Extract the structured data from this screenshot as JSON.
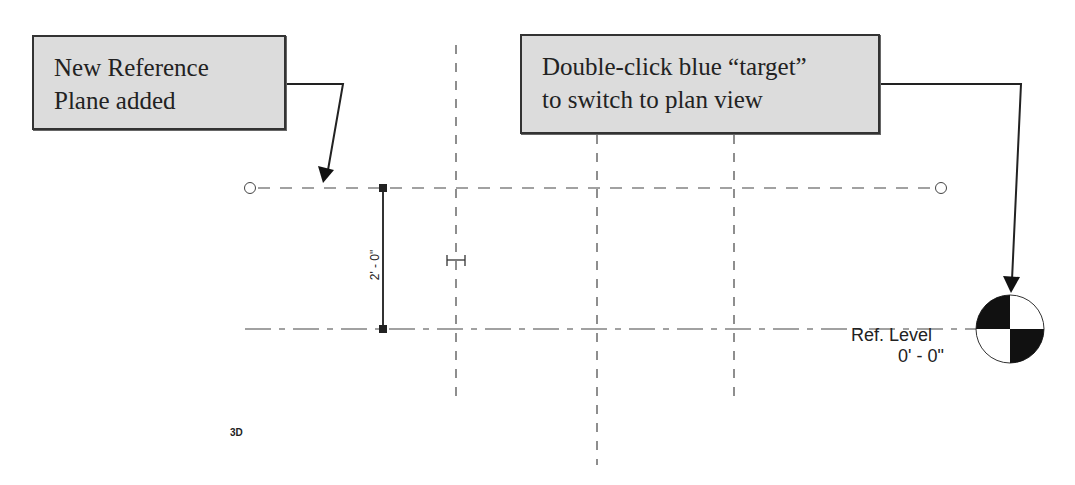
{
  "callouts": [
    {
      "lines": [
        "New Reference",
        "Plane added"
      ]
    },
    {
      "lines": [
        "Double-click blue “target”",
        "to switch to plan view"
      ]
    }
  ],
  "level": {
    "name": "Ref. Level",
    "elevation": "0' - 0\""
  },
  "dimension": {
    "value": "2' - 0\""
  },
  "view": {
    "label": "3D"
  },
  "colors": {
    "callout_bg": "#dcdcdc",
    "line": "#333333",
    "marker_fill": "#111111"
  },
  "icons": [
    "level-target-icon",
    "reference-plane-end-icon",
    "dimension-grip-icon",
    "ibeam-cursor-icon",
    "arrow-icon"
  ]
}
